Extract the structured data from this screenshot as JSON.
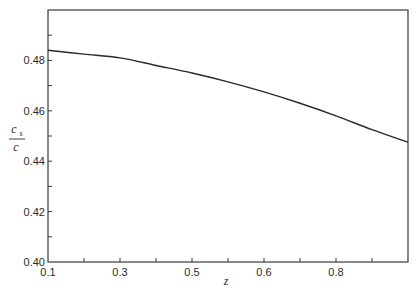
{
  "chart_data": {
    "type": "line",
    "title": "",
    "xlabel": "z",
    "ylabel": {
      "numerator": "c",
      "subscript": "s",
      "denominator": "c"
    },
    "x_tick_labels": [
      {
        "tick_index": 0,
        "label": "0.1"
      },
      {
        "tick_index": 2,
        "label": "0.3"
      },
      {
        "tick_index": 4,
        "label": "0.5"
      },
      {
        "tick_index": 6,
        "label": "0.6"
      },
      {
        "tick_index": 8,
        "label": "0.8"
      }
    ],
    "x_tick_count": 11,
    "y_ticks": [
      0.4,
      0.41,
      0.42,
      0.43,
      0.44,
      0.45,
      0.46,
      0.47,
      0.48,
      0.49
    ],
    "y_tick_labels": [
      "0.40",
      "0.42",
      "0.44",
      "0.46",
      "0.48"
    ],
    "ylim": [
      0.4,
      0.5
    ],
    "grid": false,
    "legend": "none",
    "series": [
      {
        "name": "c_s/c",
        "color": "#2a2a2a",
        "tick_index": [
          0,
          1,
          2,
          3,
          4,
          5,
          6,
          7,
          8,
          9,
          10
        ],
        "values": [
          0.484,
          0.4825,
          0.481,
          0.478,
          0.475,
          0.4715,
          0.4675,
          0.463,
          0.458,
          0.4525,
          0.4475
        ]
      }
    ]
  }
}
